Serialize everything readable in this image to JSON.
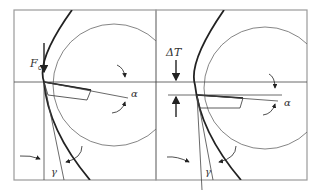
{
  "figure": {
    "panels": [
      {
        "id": "left",
        "labels": {
          "force": "F",
          "force_subscript": "c",
          "clearance_angle": "α",
          "rake_angle": "γ"
        }
      },
      {
        "id": "right",
        "labels": {
          "offset": "ΔT",
          "clearance_angle": "α",
          "rake_angle": "γ"
        }
      }
    ],
    "colors": {
      "frame": "#9a9a9a",
      "thin_line": "#555555",
      "thick_line": "#222222",
      "text": "#333333"
    }
  }
}
